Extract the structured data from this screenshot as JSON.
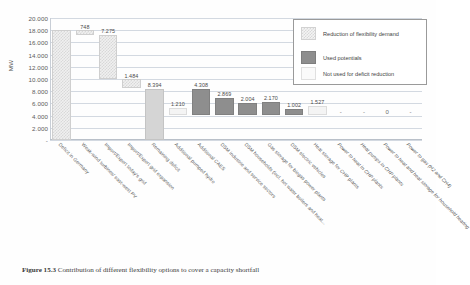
{
  "chart_data": {
    "type": "bar",
    "title": "",
    "subtitle": "",
    "xlabel": "",
    "ylabel": "MW",
    "ylim": [
      0,
      20000
    ],
    "grid": true,
    "legend_position": "top-right",
    "ytick_labels": [
      "20.000",
      "18.000",
      "16.000",
      "14.000",
      "12.000",
      "10.000",
      "8.000",
      "6.000",
      "4.000",
      "2.000",
      "-"
    ],
    "ytick_values": [
      20000,
      18000,
      16000,
      14000,
      12000,
      10000,
      8000,
      6000,
      4000,
      2000,
      0
    ],
    "categories": [
      "Deficit in Germany",
      "Weak-wind turbines/ east-west PV",
      "Import/Export today's grid",
      "Import/Export grid expansion",
      "Remaining deficit",
      "Additional pumped hydro",
      "Additional CAES",
      "DSM industrie and service sectors",
      "DSM households (incl. hot water boilers and heat...",
      "Gas storage for biogas power plants",
      "DSM electric vehicles",
      "Heat storage for CHP plants",
      "Power to heat in CHP plants",
      "Heat pumps in CHP plants",
      "Power to heat and heat storage for household heating",
      "Power to gas (H2 and CH4)"
    ],
    "category_styles": [
      "normal",
      "normal",
      "normal",
      "normal",
      "normal",
      "normal",
      "normal",
      "normal",
      "normal",
      "normal",
      "normal",
      "normal",
      "italic",
      "italic",
      "italic",
      "italic"
    ],
    "data_labels": [
      "",
      "748",
      "7.275",
      "",
      "1.484",
      "8.394",
      "4.308",
      "1.210",
      "2.869",
      "2.004",
      "2.170",
      "1.527",
      "1.002",
      "-",
      "-",
      "0",
      "-"
    ],
    "series": [
      {
        "name": "Reduction of flexibility demand",
        "style": "hatch",
        "bars": [
          {
            "category": "Deficit in Germany",
            "base": 0,
            "value": 18000,
            "label": ""
          },
          {
            "category": "Weak-wind turbines/ east-west PV",
            "base": 17252,
            "value": 748,
            "label": "748"
          },
          {
            "category": "Import/Export today's grid",
            "base": 9977,
            "value": 7275,
            "label": "7.275"
          },
          {
            "category": "Import/Export grid expansion",
            "base": 8493,
            "value": 1484,
            "label": "1.484"
          }
        ]
      },
      {
        "name": "Used potentials",
        "style": "dark",
        "bars": [
          {
            "category": "Additional CAES",
            "base": 4085,
            "value": 4308,
            "label": "4.308"
          },
          {
            "category": "DSM industrie and service sectors",
            "base": 4085,
            "value": 2869,
            "label": "2.869"
          },
          {
            "category": "DSM households (incl. hot water boilers and heat...",
            "base": 4085,
            "value": 2004,
            "label": "2.004"
          },
          {
            "category": "Gas storage for biogas power plants",
            "base": 4085,
            "value": 2170,
            "label": "2.170"
          },
          {
            "category": "DSM electric vehicles",
            "base": 4085,
            "value": 1002,
            "label": "1.002"
          }
        ]
      },
      {
        "name": "Not used for deficit reduction",
        "style": "light",
        "bars": [
          {
            "category": "Remaining deficit",
            "base": 0,
            "value": 8394,
            "label": "8.394"
          },
          {
            "category": "Additional pumped hydro",
            "base": 4085,
            "value": 1210,
            "label": "1.210"
          },
          {
            "category": "Heat storage for CHP plants",
            "base": 4085,
            "value": 1527,
            "label": "1.527"
          },
          {
            "category": "Power to heat in CHP plants",
            "base": 0,
            "value": 0,
            "label": "-"
          },
          {
            "category": "Heat pumps in CHP plants",
            "base": 0,
            "value": 0,
            "label": "-"
          },
          {
            "category": "Power to heat and heat storage for household heating",
            "base": 0,
            "value": 0,
            "label": "0"
          },
          {
            "category": "Power to gas (H2 and CH4)",
            "base": 0,
            "value": 0,
            "label": "-"
          }
        ]
      }
    ]
  },
  "legend": {
    "items": [
      {
        "label": "Reduction of flexibility demand",
        "style": "hatch"
      },
      {
        "label": "Used potentials",
        "style": "dark"
      },
      {
        "label": "Not used for deficit reduction",
        "style": "light"
      }
    ]
  },
  "caption": {
    "figure_number": "Figure 15.3",
    "text": "Contribution of different flexibility options to cover a capacity shortfall"
  }
}
